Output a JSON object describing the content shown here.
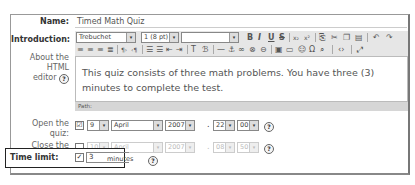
{
  "form": {
    "name": {
      "label": "Name:",
      "value": "Timed Math Quiz"
    },
    "introduction": {
      "label": "Introduction:",
      "help_label_line1": "About the",
      "help_label_line2": "HTML",
      "help_label_line3": "editor",
      "font_family": "Trebuchet",
      "font_size": "1 (8 pt)",
      "paragraph_style": "",
      "content": "This quiz consists of three math problems. You have three (3) minutes to complete the test.",
      "path_label": "Path:",
      "toolbar_row1": [
        "bold-icon",
        "italic-icon",
        "underline-icon",
        "strikethrough-icon",
        "subscript-icon",
        "superscript-icon",
        "clean-word-icon",
        "cut-icon",
        "copy-icon",
        "paste-icon",
        "undo-icon",
        "redo-icon"
      ],
      "toolbar_row2": [
        "align-left-icon",
        "align-center-icon",
        "align-right-icon",
        "justify-icon",
        "ltr-icon",
        "rtl-icon",
        "ordered-list-icon",
        "unordered-list-icon",
        "outdent-icon",
        "indent-icon",
        "text-color-icon",
        "bg-color-icon",
        "hr-icon",
        "anchor-icon",
        "link-icon",
        "unlink-icon",
        "nolink-icon",
        "image-icon",
        "table-icon",
        "smiley-icon",
        "special-char-icon",
        "search-replace-icon",
        "html-source-icon",
        "fullscreen-icon"
      ]
    },
    "open": {
      "label_line1": "Open the",
      "label_line2": "quiz:",
      "enabled": true,
      "checkbox": "☑",
      "day": "9",
      "month": "April",
      "year": "2007",
      "sep": ".",
      "hour": "22",
      "minute": "00"
    },
    "close": {
      "label_line1": "Close the",
      "label_line2": "quiz:",
      "enabled": false,
      "checkbox": "",
      "day": "10",
      "month": "April",
      "year": "2007",
      "sep": ".",
      "hour": "08",
      "minute": "50"
    },
    "time_limit": {
      "label": "Time limit:",
      "enabled": true,
      "checkbox": "✓",
      "value": "3",
      "unit": "minutes"
    },
    "help_glyph": "?",
    "dropdown_glyph": "▾"
  }
}
